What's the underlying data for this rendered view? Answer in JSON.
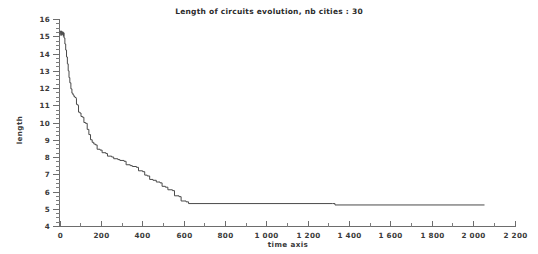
{
  "chart_data": {
    "type": "line",
    "title": "Length of circuits evolution, nb cities : 30",
    "xlabel": "time axis",
    "ylabel": "length",
    "xlim": [
      0,
      2200
    ],
    "ylim": [
      4,
      16
    ],
    "grid": false,
    "legend": null,
    "x_ticks": [
      0,
      200,
      400,
      600,
      800,
      1000,
      1200,
      1400,
      1600,
      1800,
      2000,
      2200
    ],
    "x_tick_labels": [
      "0",
      "200",
      "400",
      "600",
      "800",
      "1 000",
      "1 200",
      "1 400",
      "1 600",
      "1 800",
      "2 000",
      "2 200"
    ],
    "x_minor_tick_step": 100,
    "y_ticks": [
      4,
      5,
      6,
      7,
      8,
      9,
      10,
      11,
      12,
      13,
      14,
      15,
      16
    ],
    "y_tick_labels": [
      "4",
      "5",
      "6",
      "7",
      "8",
      "9",
      "10",
      "11",
      "12",
      "13",
      "14",
      "15",
      "16"
    ],
    "y_minor_tick_step": 0.25,
    "series": [
      {
        "name": "circuit length",
        "color": "#4a4a4a",
        "points": [
          [
            0,
            15.15
          ],
          [
            3,
            15.3
          ],
          [
            6,
            15.05
          ],
          [
            9,
            15.3
          ],
          [
            12,
            15.1
          ],
          [
            15,
            15.25
          ],
          [
            18,
            15.0
          ],
          [
            20,
            15.2
          ],
          [
            22,
            14.9
          ],
          [
            26,
            14.55
          ],
          [
            30,
            14.2
          ],
          [
            34,
            13.8
          ],
          [
            38,
            13.4
          ],
          [
            42,
            13.0
          ],
          [
            46,
            12.6
          ],
          [
            50,
            12.3
          ],
          [
            55,
            11.95
          ],
          [
            60,
            11.7
          ],
          [
            65,
            11.6
          ],
          [
            70,
            11.5
          ],
          [
            75,
            11.45
          ],
          [
            80,
            11.4
          ],
          [
            82,
            11.05
          ],
          [
            88,
            11.0
          ],
          [
            92,
            10.6
          ],
          [
            98,
            10.55
          ],
          [
            104,
            10.35
          ],
          [
            112,
            10.3
          ],
          [
            118,
            10.0
          ],
          [
            126,
            9.95
          ],
          [
            134,
            9.6
          ],
          [
            142,
            9.3
          ],
          [
            150,
            9.0
          ],
          [
            158,
            8.85
          ],
          [
            166,
            8.75
          ],
          [
            174,
            8.7
          ],
          [
            182,
            8.45
          ],
          [
            196,
            8.4
          ],
          [
            206,
            8.25
          ],
          [
            224,
            8.2
          ],
          [
            232,
            8.05
          ],
          [
            252,
            8.0
          ],
          [
            262,
            7.9
          ],
          [
            282,
            7.85
          ],
          [
            292,
            7.8
          ],
          [
            312,
            7.75
          ],
          [
            322,
            7.55
          ],
          [
            342,
            7.5
          ],
          [
            352,
            7.45
          ],
          [
            372,
            7.4
          ],
          [
            382,
            7.2
          ],
          [
            402,
            7.15
          ],
          [
            412,
            6.95
          ],
          [
            424,
            6.9
          ],
          [
            436,
            6.7
          ],
          [
            452,
            6.65
          ],
          [
            468,
            6.55
          ],
          [
            486,
            6.5
          ],
          [
            496,
            6.3
          ],
          [
            512,
            6.25
          ],
          [
            524,
            6.1
          ],
          [
            546,
            6.05
          ],
          [
            556,
            5.75
          ],
          [
            578,
            5.7
          ],
          [
            588,
            5.45
          ],
          [
            612,
            5.4
          ],
          [
            624,
            5.3
          ],
          [
            1320,
            5.3
          ],
          [
            1332,
            5.22
          ],
          [
            2055,
            5.22
          ]
        ]
      }
    ],
    "annotations": [
      {
        "text": "initial oscillation near t = 0",
        "x": 10,
        "y": 15.2
      }
    ]
  }
}
